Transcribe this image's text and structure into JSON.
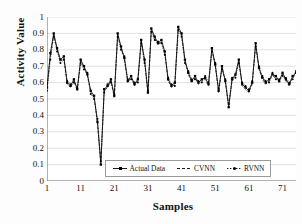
{
  "chart_data": {
    "type": "line",
    "title": "",
    "xlabel": "Samples",
    "ylabel": "Activity Value",
    "xlim": [
      1,
      75
    ],
    "ylim": [
      0,
      1
    ],
    "grid": true,
    "legend_position": "inside-bottom-center",
    "xticks": [
      "1",
      "11",
      "21",
      "31",
      "41",
      "51",
      "61",
      "71"
    ],
    "xtick_values": [
      1,
      11,
      21,
      31,
      41,
      51,
      61,
      71
    ],
    "yticks": [
      "0",
      "0.1",
      "0.2",
      "0.3",
      "0.4",
      "0.5",
      "0.6",
      "0.7",
      "0.8",
      "0.9",
      "1"
    ],
    "ytick_values": [
      0,
      0.1,
      0.2,
      0.3,
      0.4,
      0.5,
      0.6,
      0.7,
      0.8,
      0.9,
      1
    ],
    "x": [
      1,
      2,
      3,
      4,
      5,
      6,
      7,
      8,
      9,
      10,
      11,
      12,
      13,
      14,
      15,
      16,
      17,
      18,
      19,
      20,
      21,
      22,
      23,
      24,
      25,
      26,
      27,
      28,
      29,
      30,
      31,
      32,
      33,
      34,
      35,
      36,
      37,
      38,
      39,
      40,
      41,
      42,
      43,
      44,
      45,
      46,
      47,
      48,
      49,
      50,
      51,
      52,
      53,
      54,
      55,
      56,
      57,
      58,
      59,
      60,
      61,
      62,
      63,
      64,
      65,
      66,
      67,
      68,
      69,
      70,
      71,
      72,
      73,
      74,
      75
    ],
    "series": [
      {
        "name": "Actual Data",
        "color": "#000000",
        "style": "solid",
        "marker": "square",
        "values": [
          0.57,
          0.78,
          0.9,
          0.81,
          0.74,
          0.76,
          0.6,
          0.58,
          0.62,
          0.56,
          0.74,
          0.7,
          0.65,
          0.55,
          0.52,
          0.36,
          0.1,
          0.56,
          0.58,
          0.62,
          0.52,
          0.9,
          0.82,
          0.75,
          0.61,
          0.64,
          0.59,
          0.62,
          0.86,
          0.74,
          0.54,
          0.93,
          0.88,
          0.84,
          0.86,
          0.79,
          0.62,
          0.58,
          0.6,
          0.94,
          0.9,
          0.74,
          0.66,
          0.61,
          0.64,
          0.6,
          0.62,
          0.63,
          0.59,
          0.81,
          0.71,
          0.55,
          0.7,
          0.61,
          0.45,
          0.62,
          0.65,
          0.74,
          0.59,
          0.57,
          0.55,
          0.6,
          0.84,
          0.69,
          0.63,
          0.6,
          0.62,
          0.65,
          0.64,
          0.61,
          0.66,
          0.62,
          0.59,
          0.64,
          0.66
        ]
      },
      {
        "name": "CVNN",
        "color": "#000000",
        "style": "dashed",
        "marker": "none",
        "values": [
          0.56,
          0.76,
          0.89,
          0.8,
          0.73,
          0.75,
          0.59,
          0.57,
          0.61,
          0.55,
          0.73,
          0.69,
          0.64,
          0.54,
          0.51,
          0.35,
          0.11,
          0.55,
          0.57,
          0.61,
          0.51,
          0.89,
          0.81,
          0.74,
          0.6,
          0.63,
          0.58,
          0.61,
          0.85,
          0.73,
          0.53,
          0.92,
          0.87,
          0.83,
          0.85,
          0.78,
          0.61,
          0.57,
          0.59,
          0.93,
          0.89,
          0.73,
          0.65,
          0.6,
          0.63,
          0.59,
          0.61,
          0.62,
          0.58,
          0.8,
          0.7,
          0.54,
          0.69,
          0.6,
          0.46,
          0.61,
          0.64,
          0.73,
          0.58,
          0.56,
          0.54,
          0.59,
          0.83,
          0.68,
          0.62,
          0.59,
          0.61,
          0.64,
          0.63,
          0.6,
          0.65,
          0.61,
          0.58,
          0.63,
          0.65
        ]
      },
      {
        "name": "RVNN",
        "color": "#000000",
        "style": "dotted",
        "marker": "dot",
        "values": [
          0.55,
          0.74,
          0.88,
          0.79,
          0.72,
          0.74,
          0.61,
          0.59,
          0.6,
          0.57,
          0.72,
          0.68,
          0.66,
          0.53,
          0.5,
          0.38,
          0.12,
          0.54,
          0.59,
          0.6,
          0.53,
          0.88,
          0.8,
          0.76,
          0.62,
          0.62,
          0.6,
          0.6,
          0.84,
          0.72,
          0.55,
          0.91,
          0.86,
          0.85,
          0.84,
          0.77,
          0.63,
          0.59,
          0.58,
          0.92,
          0.88,
          0.72,
          0.67,
          0.62,
          0.62,
          0.61,
          0.6,
          0.64,
          0.6,
          0.79,
          0.72,
          0.56,
          0.68,
          0.62,
          0.47,
          0.63,
          0.63,
          0.72,
          0.6,
          0.58,
          0.56,
          0.61,
          0.82,
          0.7,
          0.64,
          0.61,
          0.6,
          0.66,
          0.62,
          0.62,
          0.64,
          0.63,
          0.6,
          0.62,
          0.67
        ]
      }
    ]
  },
  "legend": {
    "items": [
      {
        "label": "Actual Data",
        "marker": "line-square"
      },
      {
        "label": "CVNN",
        "marker": "line-dashed"
      },
      {
        "label": "RVNN",
        "marker": "line-dot"
      }
    ]
  }
}
